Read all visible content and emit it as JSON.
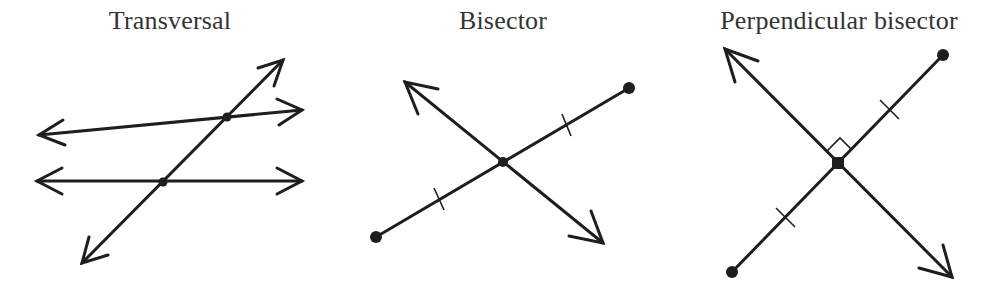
{
  "figures": [
    {
      "id": "transversal",
      "title": "Transversal",
      "description": "Two lines crossed by a transversal line, with intersection points marked"
    },
    {
      "id": "bisector",
      "title": "Bisector",
      "description": "A line passing through the midpoint of a segment; equal-length tick marks on each half"
    },
    {
      "id": "perpendicular-bisector",
      "title": "Perpendicular bisector",
      "description": "A line through the midpoint of a segment at a right angle; equal tick marks and right-angle symbol"
    }
  ],
  "colors": {
    "stroke": "#1e1e1e",
    "text": "#333333",
    "background": "#ffffff"
  }
}
